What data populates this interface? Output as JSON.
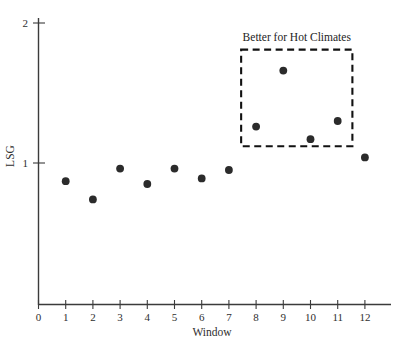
{
  "chart_data": {
    "type": "scatter",
    "title": "",
    "xlabel": "Window",
    "ylabel": "LSG",
    "xlim": [
      0,
      12.95
    ],
    "ylim": [
      0,
      2
    ],
    "grid": false,
    "legend": null,
    "x": [
      1,
      2,
      3,
      4,
      5,
      6,
      7,
      8,
      9,
      10,
      11,
      12
    ],
    "values": [
      0.87,
      0.74,
      0.96,
      0.85,
      0.96,
      0.89,
      0.95,
      1.26,
      1.66,
      1.17,
      1.3,
      1.04
    ],
    "series": [
      {
        "name": "LSG",
        "marker": "circle",
        "color": "#2b2b2b",
        "points": [
          {
            "x": 1,
            "y": 0.87
          },
          {
            "x": 2,
            "y": 0.74
          },
          {
            "x": 3,
            "y": 0.96
          },
          {
            "x": 4,
            "y": 0.85
          },
          {
            "x": 5,
            "y": 0.96
          },
          {
            "x": 6,
            "y": 0.89
          },
          {
            "x": 7,
            "y": 0.95
          },
          {
            "x": 8,
            "y": 1.26
          },
          {
            "x": 9,
            "y": 1.66
          },
          {
            "x": 10,
            "y": 1.17
          },
          {
            "x": 11,
            "y": 1.3
          },
          {
            "x": 12,
            "y": 1.04
          }
        ]
      }
    ],
    "x_ticks": [
      "0",
      "1",
      "2",
      "3",
      "4",
      "5",
      "6",
      "7",
      "8",
      "9",
      "10",
      "11",
      "12"
    ],
    "x_tick_values": [
      0,
      1,
      2,
      3,
      4,
      5,
      6,
      7,
      8,
      9,
      10,
      11,
      12
    ],
    "y_ticks": [
      "1",
      "2"
    ],
    "y_tick_values": [
      1,
      2
    ],
    "annotations": [
      {
        "text": "Better for Hot Climates",
        "type": "dashed-rectangle-with-label",
        "x_range": [
          7.45,
          11.54
        ],
        "y_range": [
          1.12,
          1.81
        ],
        "covers_points": [
          8,
          9,
          10,
          11
        ]
      }
    ]
  },
  "colors": {
    "marker": "#2b2b2b",
    "axis": "#3b3b3b",
    "annotation": "#111111",
    "text": "#2e2e2e",
    "background": "#ffffff"
  }
}
